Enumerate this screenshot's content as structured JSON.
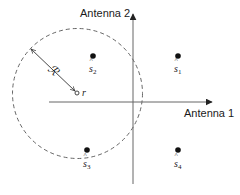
{
  "diagram": {
    "type": "constellation-decision-region",
    "axes": {
      "x_label": "Antenna 1",
      "y_label": "Antenna 2",
      "color": "#555555"
    },
    "points": [
      {
        "id": "s1",
        "symbol": "s",
        "subscript": "1",
        "x": 178,
        "y": 56
      },
      {
        "id": "s2",
        "symbol": "s",
        "subscript": "2",
        "x": 93,
        "y": 56
      },
      {
        "id": "s3",
        "symbol": "s",
        "subscript": "3",
        "x": 87,
        "y": 150
      },
      {
        "id": "s4",
        "symbol": "s",
        "subscript": "4",
        "x": 178,
        "y": 150
      }
    ],
    "received_point": {
      "label": "r",
      "x": 77,
      "y": 93
    },
    "sphere": {
      "radius_label": "ℛ",
      "center_x": 77.5,
      "center_y": 93.5,
      "radius": 65,
      "style": "dashed"
    },
    "colors": {
      "ink": "#111111",
      "axis": "#555555",
      "dash": "#555555"
    }
  }
}
